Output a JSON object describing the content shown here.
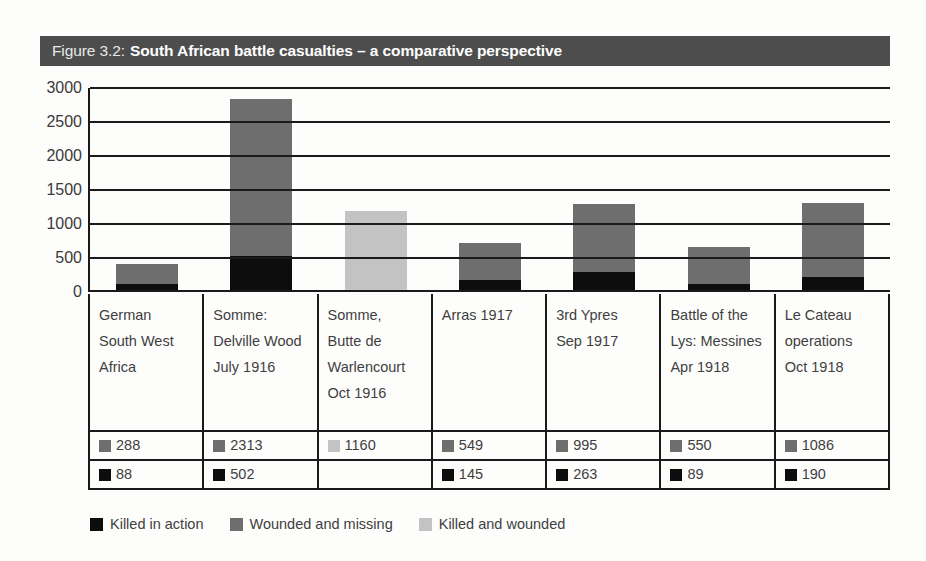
{
  "figure": {
    "title_prefix": "Figure 3.2:",
    "title_main": "South African battle casualties – a comparative perspective"
  },
  "colors": {
    "killed_in_action": "#0d0d0d",
    "wounded_and_missing": "#6e6e6e",
    "killed_and_wounded": "#c3c3c3",
    "title_bar": "#4d4d4d",
    "axis": "#1a1a1a",
    "text": "#3f3f3f"
  },
  "legend": {
    "items": [
      {
        "label": "Killed in action",
        "color": "#0d0d0d",
        "key": "killed_in_action"
      },
      {
        "label": "Wounded and missing",
        "color": "#6e6e6e",
        "key": "wounded_and_missing"
      },
      {
        "label": "Killed and wounded",
        "color": "#c3c3c3",
        "key": "killed_and_wounded"
      }
    ]
  },
  "chart_data": {
    "type": "bar",
    "stacked": true,
    "title": "Figure 3.2: South African battle casualties – a comparative perspective",
    "xlabel": "",
    "ylabel": "",
    "ylim": [
      0,
      3000
    ],
    "yticks": [
      0,
      500,
      1000,
      1500,
      2000,
      2500,
      3000
    ],
    "ytick_labels": [
      "0",
      "500",
      "1000",
      "1500",
      "2000",
      "2500",
      "3000"
    ],
    "grid": true,
    "legend_position": "bottom",
    "categories": [
      "German South West Africa",
      "Somme: Delville Wood July 1916",
      "Somme, Butte de Warlencourt Oct 1916",
      "Arras 1917",
      "3rd Ypres Sep 1917",
      "Battle of the Lys: Messines Apr 1918",
      "Le Cateau operations Oct 1918"
    ],
    "category_lines": [
      [
        "German",
        "South West",
        "Africa"
      ],
      [
        "Somme:",
        "Delville Wood",
        "July 1916"
      ],
      [
        "Somme,",
        "Butte de",
        "Warlencourt",
        "Oct 1916"
      ],
      [
        "Arras 1917"
      ],
      [
        "3rd Ypres",
        "Sep 1917"
      ],
      [
        "Battle of the",
        "Lys: Messines",
        "Apr 1918"
      ],
      [
        "Le Cateau",
        "operations",
        "Oct 1918"
      ]
    ],
    "series": [
      {
        "name": "Killed in action",
        "color": "#0d0d0d",
        "values": [
          88,
          502,
          null,
          145,
          263,
          89,
          190
        ]
      },
      {
        "name": "Wounded and missing",
        "color": "#6e6e6e",
        "values": [
          288,
          2313,
          null,
          549,
          995,
          550,
          1086
        ]
      },
      {
        "name": "Killed and wounded",
        "color": "#c3c3c3",
        "values": [
          null,
          null,
          1160,
          null,
          null,
          null,
          null
        ]
      }
    ],
    "totals": [
      376,
      2815,
      1160,
      694,
      1258,
      639,
      1276
    ]
  },
  "table": {
    "row_upper": [
      {
        "value": "288",
        "color": "#6e6e6e"
      },
      {
        "value": "2313",
        "color": "#6e6e6e"
      },
      {
        "value": "1160",
        "color": "#c3c3c3"
      },
      {
        "value": "549",
        "color": "#6e6e6e"
      },
      {
        "value": "995",
        "color": "#6e6e6e"
      },
      {
        "value": "550",
        "color": "#6e6e6e"
      },
      {
        "value": "1086",
        "color": "#6e6e6e"
      }
    ],
    "row_lower": [
      {
        "value": "88",
        "color": "#0d0d0d"
      },
      {
        "value": "502",
        "color": "#0d0d0d"
      },
      {
        "value": "",
        "color": null
      },
      {
        "value": "145",
        "color": "#0d0d0d"
      },
      {
        "value": "263",
        "color": "#0d0d0d"
      },
      {
        "value": "89",
        "color": "#0d0d0d"
      },
      {
        "value": "190",
        "color": "#0d0d0d"
      }
    ]
  }
}
